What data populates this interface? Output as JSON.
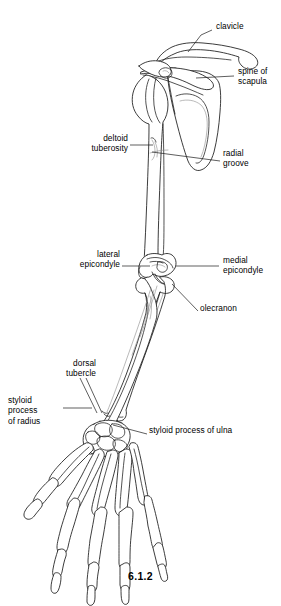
{
  "figure": {
    "caption": "6.1.2",
    "view": "posterior view of right upper limb skeleton",
    "background_color": "#ffffff",
    "line_color": "#1a1a1a"
  },
  "labels": [
    {
      "id": "clavicle",
      "text": "clavicle",
      "align": "left",
      "x": 216,
      "y": 26,
      "width": 60
    },
    {
      "id": "spine-of-scapula",
      "text": "spine of\nscapula",
      "align": "left",
      "x": 238,
      "y": 71,
      "width": 44
    },
    {
      "id": "deltoid-tuberosity",
      "text": "deltoid\ntuberosity",
      "align": "right",
      "x": 42,
      "y": 138,
      "width": 86
    },
    {
      "id": "radial-groove",
      "text": "radial\ngroove",
      "align": "left",
      "x": 223,
      "y": 153,
      "width": 50
    },
    {
      "id": "lateral-epicondyle",
      "text": "lateral\nepicondyle",
      "align": "right",
      "x": 28,
      "y": 254,
      "width": 92
    },
    {
      "id": "medial-epicondyle",
      "text": "medial\nepicondyle",
      "align": "left",
      "x": 223,
      "y": 260,
      "width": 56
    },
    {
      "id": "olecranon",
      "text": "olecranon",
      "align": "left",
      "x": 200,
      "y": 308,
      "width": 48
    },
    {
      "id": "dorsal-tubercle",
      "text": "dorsal\ntubercle",
      "align": "right",
      "x": 22,
      "y": 363,
      "width": 74
    },
    {
      "id": "styloid-process-of-radius",
      "text": "styloid\nprocess\nof radius",
      "align": "left",
      "x": 8,
      "y": 400,
      "width": 54
    },
    {
      "id": "styloid-process-of-ulna",
      "text": "styloid process of ulna",
      "align": "left",
      "x": 149,
      "y": 430,
      "width": 120
    }
  ],
  "leader_lines": [
    {
      "id": "leader-clavicle",
      "points": "212,30 201,35 188,52"
    },
    {
      "id": "leader-spine-scapula",
      "points": "234,76 196,78"
    },
    {
      "id": "leader-deltoid",
      "points": "130,145 153,145"
    },
    {
      "id": "leader-radial-groove",
      "points": "220,161 152,152"
    },
    {
      "id": "leader-lateral-epi",
      "points": "122,266 150,266"
    },
    {
      "id": "leader-medial-epi",
      "points": "219,266 176,266"
    },
    {
      "id": "leader-olecranon",
      "points": "198,311 172,284"
    },
    {
      "id": "leader-dorsal-tubercle",
      "points": "80,378 97,413"
    },
    {
      "id": "leader-dorsal-tubercle2",
      "points": "86,378 102,413"
    },
    {
      "id": "leader-styloid-radius",
      "points": "63,408 92,408"
    },
    {
      "id": "leader-styloid-ulna",
      "points": "147,434 113,425"
    }
  ],
  "bones": [
    "clavicle",
    "scapula",
    "spine of scapula",
    "humerus",
    "radius",
    "ulna",
    "carpal bones",
    "metacarpal bones",
    "phalanges"
  ]
}
